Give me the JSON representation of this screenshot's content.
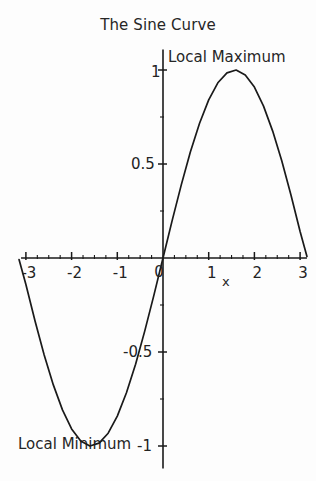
{
  "chart_data": {
    "type": "line",
    "title": "The Sine Curve",
    "xlabel": "x",
    "ylabel": "",
    "xlim": [
      -3.15,
      3.15
    ],
    "ylim": [
      -1.12,
      1.12
    ],
    "grid": false,
    "legend": null,
    "line_color": "#1a1a1a",
    "axis_color": "#1a1a1a",
    "background_color": "#fdfdfd",
    "xticks": [
      -3,
      -2,
      -1,
      0,
      1,
      2,
      3
    ],
    "xticklabels": [
      "-3",
      "-2",
      "-1",
      "0",
      "1",
      "2",
      "3"
    ],
    "yticks": [
      -1,
      -0.5,
      0.5,
      1
    ],
    "yticklabels": [
      "-1",
      "-0.5",
      "0.5",
      "1"
    ],
    "minor_tick_step": 0.25,
    "series": [
      {
        "name": "sin(x)",
        "x": [
          -3.15,
          -3.0,
          -2.8,
          -2.6,
          -2.4,
          -2.2,
          -2.0,
          -1.8,
          -1.6,
          -1.4,
          -1.2,
          -1.0,
          -0.8,
          -0.6,
          -0.4,
          -0.2,
          0.0,
          0.2,
          0.4,
          0.6,
          0.8,
          1.0,
          1.2,
          1.4,
          1.6,
          1.8,
          2.0,
          2.2,
          2.4,
          2.6,
          2.8,
          3.0,
          3.15
        ],
        "y": [
          -0.008,
          -0.141,
          -0.335,
          -0.516,
          -0.675,
          -0.808,
          -0.909,
          -0.974,
          -1.0,
          -0.985,
          -0.932,
          -0.841,
          -0.717,
          -0.565,
          -0.389,
          -0.199,
          0.0,
          0.199,
          0.389,
          0.565,
          0.717,
          0.841,
          0.932,
          0.985,
          1.0,
          0.974,
          0.909,
          0.808,
          0.675,
          0.516,
          0.335,
          0.141,
          0.008
        ]
      }
    ],
    "annotations": [
      {
        "name": "local-maximum",
        "text": "Local Maximum",
        "x": 1.5708,
        "y": 1.0
      },
      {
        "name": "local-minimum",
        "text": "Local Minimum",
        "x": -1.5708,
        "y": -1.0
      }
    ]
  }
}
